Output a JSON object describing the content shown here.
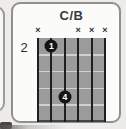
{
  "chord": {
    "title": "C/B",
    "starting_fret_label": "2",
    "string_count": 6,
    "fret_count": 5,
    "muted_marker": "×",
    "muted_strings": [
      1,
      4,
      5,
      6
    ],
    "fingerings": [
      {
        "label": "1",
        "string": 2,
        "fret": 1
      },
      {
        "label": "4",
        "string": 3,
        "fret": 4
      }
    ]
  },
  "colors": {
    "page_background": "#edecea",
    "card_background": "#fbfbfa",
    "card_border": "#8f8f8f",
    "grid_fill": "#9b9b9b",
    "string_color": "#1f1f1f",
    "fret_line_color": "#d2d1cf",
    "dot_color": "#141414",
    "dot_text_color": "#ffffff",
    "text_color": "#3a3a3a"
  }
}
